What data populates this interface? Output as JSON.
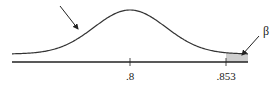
{
  "chart_data": {
    "type": "area",
    "title": "",
    "xlabel": "",
    "ylabel": "",
    "distribution": "normal",
    "mean": 0.8,
    "tick_labels": [
      ".8",
      ".853"
    ],
    "ticks": [
      0.8,
      0.853
    ],
    "shaded_region": {
      "from": 0.853,
      "to": "right tail",
      "label": "β"
    },
    "annotations": [
      {
        "label": "",
        "points_to": "curve left side"
      },
      {
        "label": "β",
        "points_to": "shaded right tail"
      }
    ],
    "colors": {
      "curve": "#333333",
      "shade": "#cfcfcf",
      "axis": "#222222"
    }
  }
}
